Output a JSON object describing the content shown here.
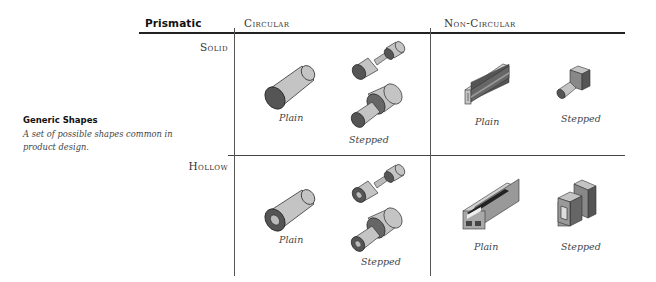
{
  "header": {
    "prismatic_label": "Prismatic",
    "columns": [
      "Circular",
      "Non-Circular"
    ]
  },
  "rows": [
    "Solid",
    "Hollow"
  ],
  "sidebar": {
    "title": "Generic Shapes",
    "description": "A set of possible shapes common in product design."
  },
  "cells": {
    "solid_circular": {
      "plain": "Plain",
      "stepped": "Stepped"
    },
    "solid_noncircular": {
      "plain": "Plain",
      "stepped": "Stepped"
    },
    "hollow_circular": {
      "plain": "Plain",
      "stepped": "Stepped"
    },
    "hollow_noncircular": {
      "plain": "Plain",
      "stepped": "Stepped"
    }
  },
  "colors": {
    "shape_light": "#c2c2c2",
    "shape_mid": "#9a9a9a",
    "shape_dark": "#555555",
    "line": "#222222"
  }
}
